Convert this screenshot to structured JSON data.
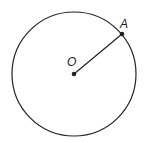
{
  "diagram": {
    "type": "circle-with-radius",
    "center": {
      "label": "O",
      "x": 74,
      "y": 74
    },
    "radius": 62,
    "point": {
      "label": "A",
      "x": 122,
      "y": 34
    },
    "colors": {
      "stroke": "#222222",
      "background": "#ffffff"
    }
  }
}
